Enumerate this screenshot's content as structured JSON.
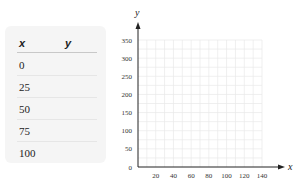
{
  "table": {
    "headers": [
      "x",
      "y"
    ],
    "rows": [
      {
        "x": "0",
        "y": ""
      },
      {
        "x": "25",
        "y": ""
      },
      {
        "x": "50",
        "y": ""
      },
      {
        "x": "75",
        "y": ""
      },
      {
        "x": "100",
        "y": ""
      }
    ]
  },
  "chart_data": {
    "type": "scatter",
    "title": "",
    "xlabel": "x",
    "ylabel": "y",
    "xlim": [
      0,
      140
    ],
    "ylim": [
      0,
      350
    ],
    "xticks": [
      20,
      40,
      60,
      80,
      100,
      120,
      140
    ],
    "yticks": [
      0,
      50,
      100,
      150,
      200,
      250,
      300,
      350
    ],
    "grid": true,
    "series": [],
    "colors": {
      "grid": "#e8e8e8",
      "axis": "#222222"
    }
  }
}
